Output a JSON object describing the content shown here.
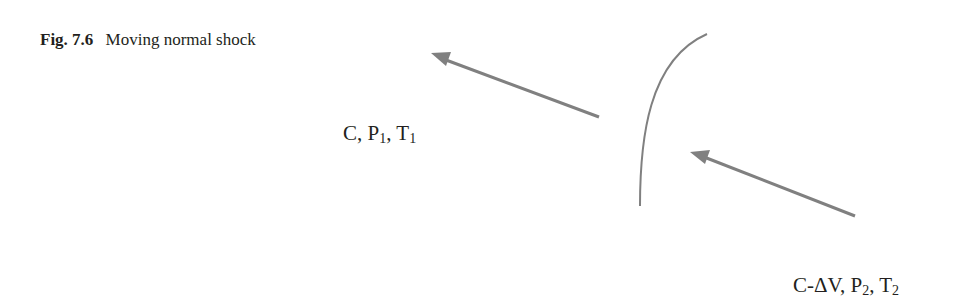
{
  "caption": {
    "label": "Fig. 7.6",
    "text": "Moving normal shock"
  },
  "upstream_state": {
    "velocity": "C",
    "sep1": ", ",
    "pressure": "P",
    "pressure_sub": "1",
    "sep2": ", ",
    "temperature": "T",
    "temperature_sub": "1"
  },
  "downstream_state": {
    "velocity": "C-ΔV",
    "sep1": ", ",
    "pressure": "P",
    "pressure_sub": "2",
    "sep2": ", ",
    "temperature": "T",
    "temperature_sub": "2"
  },
  "diagram": {
    "stroke_color": "#808080",
    "shock_wave": "curved normal shock front",
    "arrows": [
      "upstream flow arrow",
      "downstream flow arrow"
    ]
  }
}
